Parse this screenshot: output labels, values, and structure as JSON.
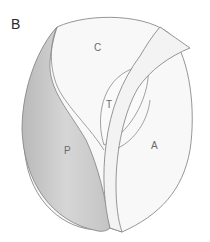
{
  "figure": {
    "panel_label": "B",
    "regions": {
      "C": "C",
      "T": "T",
      "P": "P",
      "A": "A"
    },
    "colors": {
      "outline": "#8a8a8a",
      "fill_light": "#f7f7f7",
      "fill_shaded": "#cfcfcf",
      "label": "#6a6a6a"
    }
  }
}
